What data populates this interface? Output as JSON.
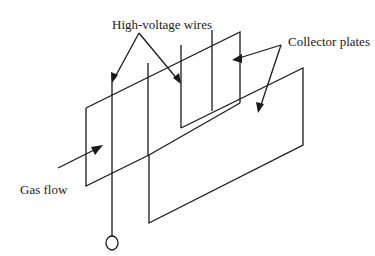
{
  "diagram": {
    "type": "electrostatic precipitator schematic",
    "labels": {
      "wires": "High-voltage wires",
      "plates": "Collector plates",
      "gas": "Gas flow"
    },
    "colors": {
      "stroke": "#1a1a1a",
      "background": "#ffffff"
    },
    "components": [
      {
        "id": "front-collector-plate",
        "label": "Collector plates"
      },
      {
        "id": "back-collector-plate",
        "label": "Collector plates"
      },
      {
        "id": "high-voltage-wire-1",
        "label": "High-voltage wires"
      },
      {
        "id": "high-voltage-wire-2",
        "label": "High-voltage wires"
      },
      {
        "id": "high-voltage-wire-3",
        "label": "High-voltage wires"
      },
      {
        "id": "high-voltage-wire-4",
        "label": "High-voltage wires"
      },
      {
        "id": "voltage-terminal",
        "label": ""
      }
    ]
  }
}
